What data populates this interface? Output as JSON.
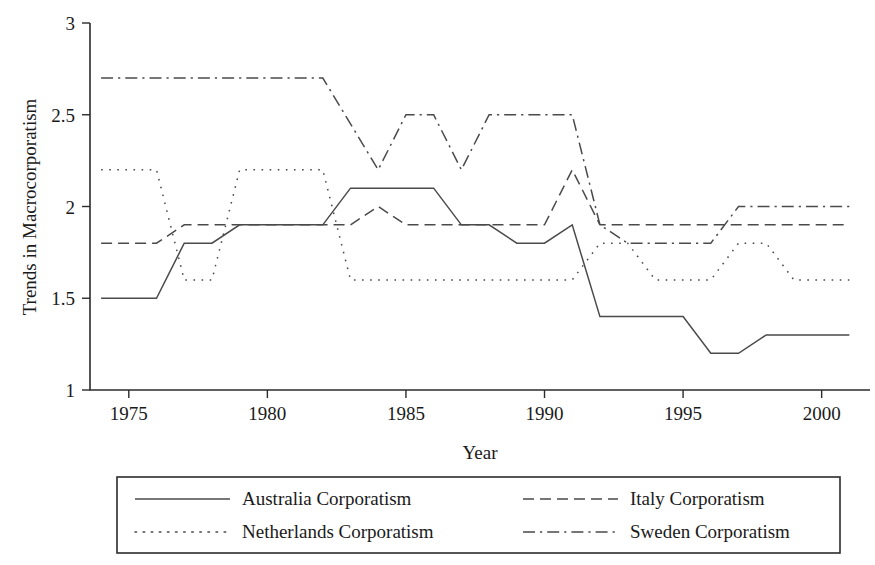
{
  "chart_data": {
    "type": "line",
    "title": "",
    "xlabel": "Year",
    "ylabel": "Trends in Macrocorporatism",
    "xlim": [
      1973.6,
      2001.6
    ],
    "ylim": [
      1,
      3
    ],
    "grid": false,
    "legend_position": "bottom",
    "xticks": [
      1975,
      1980,
      1985,
      1990,
      1995,
      2000
    ],
    "xtick_labels": [
      "1975",
      "1980",
      "1985",
      "1990",
      "1995",
      "2000"
    ],
    "yticks": [
      1,
      1.5,
      2,
      2.5,
      3
    ],
    "ytick_labels": [
      "1",
      "1.5",
      "2",
      "2.5",
      "3"
    ],
    "x": [
      1974,
      1975,
      1976,
      1977,
      1978,
      1979,
      1980,
      1981,
      1982,
      1983,
      1984,
      1985,
      1986,
      1987,
      1988,
      1989,
      1990,
      1991,
      1992,
      1993,
      1994,
      1995,
      1996,
      1997,
      1998,
      1999,
      2000,
      2001
    ],
    "series": [
      {
        "name": "Australia Corporatism",
        "dash": "solid",
        "values": [
          1.5,
          1.5,
          1.5,
          1.8,
          1.8,
          1.9,
          1.9,
          1.9,
          1.9,
          2.1,
          2.1,
          2.1,
          2.1,
          1.9,
          1.9,
          1.8,
          1.8,
          1.9,
          1.4,
          1.4,
          1.4,
          1.4,
          1.2,
          1.2,
          1.3,
          1.3,
          1.3,
          1.3
        ]
      },
      {
        "name": "Italy Corporatism",
        "dash": "dashed",
        "values": [
          1.8,
          1.8,
          1.8,
          1.9,
          1.9,
          1.9,
          1.9,
          1.9,
          1.9,
          1.9,
          2.0,
          1.9,
          1.9,
          1.9,
          1.9,
          1.9,
          1.9,
          2.2,
          1.9,
          1.9,
          1.9,
          1.9,
          1.9,
          1.9,
          1.9,
          1.9,
          1.9,
          1.9
        ]
      },
      {
        "name": "Netherlands Corporatism",
        "dash": "dotted",
        "values": [
          2.2,
          2.2,
          2.2,
          1.6,
          1.6,
          2.2,
          2.2,
          2.2,
          2.2,
          1.6,
          1.6,
          1.6,
          1.6,
          1.6,
          1.6,
          1.6,
          1.6,
          1.6,
          1.8,
          1.8,
          1.6,
          1.6,
          1.6,
          1.8,
          1.8,
          1.6,
          1.6,
          1.6
        ]
      },
      {
        "name": "Sweden Corporatism",
        "dash": "dashdot",
        "values": [
          2.7,
          2.7,
          2.7,
          2.7,
          2.7,
          2.7,
          2.7,
          2.7,
          2.7,
          2.45,
          2.2,
          2.5,
          2.5,
          2.2,
          2.5,
          2.5,
          2.5,
          2.5,
          1.9,
          1.8,
          1.8,
          1.8,
          1.8,
          2.0,
          2.0,
          2.0,
          2.0,
          2.0
        ]
      }
    ]
  },
  "legend": {
    "entries": [
      {
        "label": "Australia Corporatism",
        "dash": "solid"
      },
      {
        "label": "Italy Corporatism",
        "dash": "dashed"
      },
      {
        "label": "Netherlands Corporatism",
        "dash": "dotted"
      },
      {
        "label": "Sweden Corporatism",
        "dash": "dashdot"
      }
    ]
  }
}
